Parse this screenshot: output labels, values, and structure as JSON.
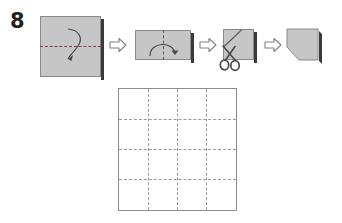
{
  "diagram": {
    "step_number": "8",
    "type": "origami-instruction",
    "colors": {
      "paper_fill": "#c6c6c6",
      "paper_border": "#8a8a8a",
      "fold_line": "#6e4b4b",
      "grid_line": "#9a9a9a",
      "shadow": "#3a3a3a",
      "step_number_color": "#231f20",
      "background": "#ffffff"
    },
    "steps": [
      {
        "id": "step-1-square",
        "name": "square-with-horizontal-fold",
        "shape": "square",
        "fold_line": "horizontal-center",
        "fold_arrow": "fold-down",
        "label": ""
      },
      {
        "id": "step-2-rectangle",
        "name": "rectangle-with-vertical-fold",
        "shape": "rectangle",
        "fold_line": "vertical-center",
        "fold_arrow": "fold-left-to-right",
        "label": ""
      },
      {
        "id": "step-3-cut",
        "name": "small-square-with-scissors-cut",
        "shape": "square",
        "cut_line": "diagonal-bottom-left-to-top-right",
        "tool": "scissors",
        "label": ""
      },
      {
        "id": "step-4-result",
        "name": "pentagon-result",
        "shape": "pentagon",
        "cut_corner": "bottom-left",
        "label": ""
      }
    ],
    "transition_arrows": [
      {
        "name": "arrow-1",
        "direction": "right"
      },
      {
        "name": "arrow-2",
        "direction": "right"
      },
      {
        "name": "arrow-3",
        "direction": "right"
      }
    ],
    "result_grid": {
      "name": "unfolded-grid-sheet",
      "columns": 4,
      "rows": 4,
      "vertical_crease_count": 3,
      "horizontal_crease_count": 3,
      "line_style": "dashed"
    }
  }
}
